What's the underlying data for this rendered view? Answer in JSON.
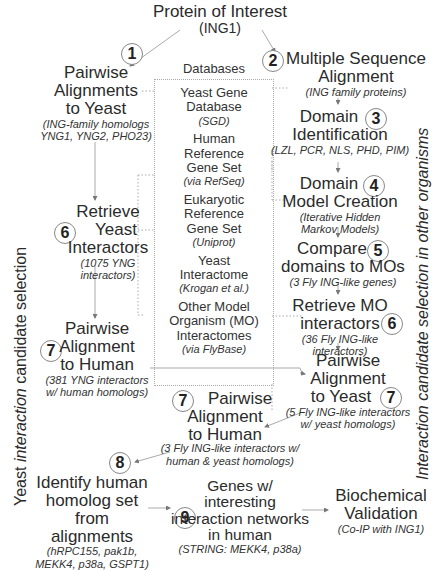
{
  "top": {
    "title": "Protein of Interest",
    "subtitle": "(ING1)"
  },
  "side_labels": {
    "left": {
      "prefix": "Yeast ",
      "italic": "interaction",
      "suffix": " candidate selection"
    },
    "right": {
      "prefix": "Interaction candidate selection ",
      "italic": "in",
      "suffix": " other organisms"
    }
  },
  "databases": {
    "header": "Databases",
    "items": [
      {
        "name_lines": [
          "Yeast Gene",
          "Database"
        ],
        "source": "(SGD)"
      },
      {
        "name_lines": [
          "Human",
          "Reference",
          "Gene Set"
        ],
        "source": "(via RefSeq)"
      },
      {
        "name_lines": [
          "Eukaryotic",
          "Reference",
          "Gene Set"
        ],
        "source": "(Uniprot)"
      },
      {
        "name_lines": [
          "Yeast",
          "Interactome"
        ],
        "source": "(Krogan et al.)"
      },
      {
        "name_lines": [
          "Other Model",
          "Organism (MO)",
          "Interactomes"
        ],
        "source": "(via FlyBase)"
      }
    ]
  },
  "steps": {
    "s1": {
      "num": "1",
      "lines": [
        "Pairwise",
        "Alignments",
        "to Yeast"
      ],
      "detail": [
        "(ING-family homologs",
        "YNG1, YNG2, PHO23)"
      ]
    },
    "s2": {
      "num": "2",
      "lines": [
        "Multiple Sequence",
        "Alignment"
      ],
      "detail": [
        "(ING family proteins)"
      ]
    },
    "s3": {
      "num": "3",
      "lines": [
        "Domain",
        "Identification"
      ],
      "detail": [
        "(LZL, PCR, NLS, PHD, PIM)"
      ]
    },
    "s4": {
      "num": "4",
      "lines": [
        "Domain",
        "Model Creation"
      ],
      "detail": [
        "(Iterative Hidden",
        "Markov Models)"
      ]
    },
    "s5": {
      "num": "5",
      "lines": [
        "Compare",
        "domains to MOs"
      ],
      "detail": [
        "(3 Fly ING-like genes)"
      ]
    },
    "s6r": {
      "num": "6",
      "lines": [
        "Retrieve MO",
        "interactors"
      ],
      "detail": [
        "(36 Fly ING-like",
        "interactors)"
      ]
    },
    "s7r": {
      "num": "7",
      "lines": [
        "Pairwise",
        "Alignment",
        "to Yeast"
      ],
      "detail": [
        "(5 Fly ING-like interactors",
        "w/ yeast homologs)"
      ]
    },
    "s6l": {
      "num": "6",
      "lines": [
        "Retrieve",
        "Yeast",
        "Interactors"
      ],
      "detail": [
        "(1075 YNG",
        "interactors)"
      ]
    },
    "s7l": {
      "num": "7",
      "lines": [
        "Pairwise",
        "Alignment",
        "to Human"
      ],
      "detail": [
        "(381 YNG interactors",
        "w/ human homologs)"
      ]
    },
    "s7c": {
      "num": "7",
      "lines": [
        "Pairwise",
        "Alignment",
        "to Human"
      ],
      "detail": [
        "(3 Fly ING-like interactors w/",
        "human & yeast homologs)"
      ]
    },
    "s8": {
      "num": "8",
      "lines": [
        "Identify human",
        "homolog set from",
        "alignments"
      ],
      "detail": [
        "(hRPC155, pak1b,",
        "MEKK4, p38a, GSPT1)"
      ]
    },
    "s9": {
      "num": "9",
      "lines": [
        "Genes w/  interesting",
        "interaction networks",
        "in human"
      ],
      "detail": [
        "(STRING: MEKK4, p38a)"
      ]
    },
    "final": {
      "lines": [
        "Biochemical",
        "Validation"
      ],
      "detail": [
        "(Co-IP with ING1)"
      ]
    }
  },
  "colors": {
    "text": "#2b2b2b",
    "line": "#999999",
    "circle_border": "#888888"
  }
}
